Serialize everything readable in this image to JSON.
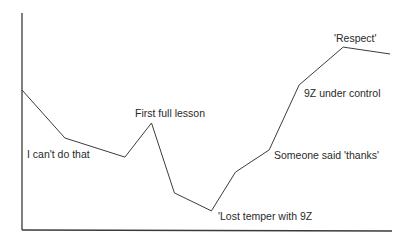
{
  "chart_data": {
    "type": "line",
    "title": "",
    "xlabel": "",
    "ylabel": "",
    "grid": false,
    "legend": null,
    "ylim": [
      0,
      100
    ],
    "xlim": [
      0,
      100
    ],
    "axis_ticks": false,
    "series": [
      {
        "name": "timeline",
        "x": [
          0,
          11.6,
          27.8,
          35.0,
          41.2,
          51.2,
          57.7,
          66.8,
          74.9,
          86.8,
          99.5
        ],
        "values": [
          64.5,
          42.4,
          33.6,
          49.3,
          17.1,
          8.8,
          26.7,
          36.9,
          66.8,
          84.3,
          81.1
        ]
      }
    ],
    "annotations": [
      {
        "text": "I can't do that",
        "near_point_index": 1
      },
      {
        "text": "First full lesson",
        "near_point_index": 3
      },
      {
        "text": "'Lost temper with 9Z",
        "near_point_index": 5
      },
      {
        "text": "Someone said 'thanks'",
        "near_point_index": 7
      },
      {
        "text": "9Z under control",
        "near_point_index": 8
      },
      {
        "text": "'Respect'",
        "near_point_index": 9
      }
    ]
  },
  "layout": {
    "plot": {
      "left": 22,
      "top": 13,
      "right": 392,
      "bottom": 230
    },
    "colors": {
      "axis": "#3a3a3a",
      "line": "#3c3c3c",
      "text": "#2a2a2a",
      "background": "#ffffff"
    },
    "label_positions": [
      {
        "x": 27,
        "y": 158
      },
      {
        "x": 135,
        "y": 117
      },
      {
        "x": 218,
        "y": 220
      },
      {
        "x": 274,
        "y": 159
      },
      {
        "x": 304,
        "y": 97
      },
      {
        "x": 334,
        "y": 42
      }
    ]
  }
}
